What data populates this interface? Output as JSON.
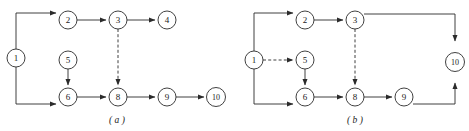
{
  "figure": {
    "background_color": "#ffffff",
    "stroke_color": "#2b2b2b",
    "text_color": "#1a1a1a",
    "width": 469,
    "height": 131
  },
  "panels": [
    {
      "id": "panel-a",
      "caption": "( a )",
      "caption_letter": "a",
      "caption_x": 117,
      "caption_y": 120,
      "nodes": [
        {
          "id": "a1",
          "label": "1",
          "cx": 16,
          "cy": 58,
          "r": 9
        },
        {
          "id": "a2",
          "label": "2",
          "cx": 68,
          "cy": 20,
          "r": 9
        },
        {
          "id": "a3",
          "label": "3",
          "cx": 118,
          "cy": 20,
          "r": 9
        },
        {
          "id": "a4",
          "label": "4",
          "cx": 167,
          "cy": 20,
          "r": 9
        },
        {
          "id": "a5",
          "label": "5",
          "cx": 68,
          "cy": 60,
          "r": 9
        },
        {
          "id": "a6",
          "label": "6",
          "cx": 68,
          "cy": 97,
          "r": 9
        },
        {
          "id": "a8",
          "label": "8",
          "cx": 118,
          "cy": 97,
          "r": 9
        },
        {
          "id": "a9",
          "label": "9",
          "cx": 167,
          "cy": 97,
          "r": 9
        },
        {
          "id": "a10",
          "label": "10",
          "cx": 216,
          "cy": 97,
          "r": 9.5
        }
      ],
      "edges": [
        {
          "id": "a-1-2",
          "from": "1",
          "to": "2",
          "style": "solid",
          "path": "M 16 49 L 16 13 L 56 13"
        },
        {
          "id": "a-2-3",
          "from": "2",
          "to": "3",
          "style": "solid",
          "path": "M 77 20 L 106 20"
        },
        {
          "id": "a-3-4",
          "from": "3",
          "to": "4",
          "style": "solid",
          "path": "M 127 20 L 155 20"
        },
        {
          "id": "a-1-6",
          "from": "1",
          "to": "6",
          "style": "solid",
          "path": "M 16 67 L 16 104 L 56 104"
        },
        {
          "id": "a-5-6",
          "from": "5",
          "to": "6",
          "style": "solid",
          "path": "M 68 69 L 68 85"
        },
        {
          "id": "a-3-8",
          "from": "3",
          "to": "8",
          "style": "dashed",
          "path": "M 118 29 L 118 85"
        },
        {
          "id": "a-6-8",
          "from": "6",
          "to": "8",
          "style": "solid",
          "path": "M 77 97 L 106 97"
        },
        {
          "id": "a-8-9",
          "from": "8",
          "to": "9",
          "style": "solid",
          "path": "M 127 97 L 155 97"
        },
        {
          "id": "a-9-10",
          "from": "9",
          "to": "10",
          "style": "solid",
          "path": "M 176 97 L 204 97"
        }
      ]
    },
    {
      "id": "panel-b",
      "caption": "( b )",
      "caption_letter": "b",
      "caption_x": 355,
      "caption_y": 120,
      "nodes": [
        {
          "id": "b1",
          "label": "1",
          "cx": 254,
          "cy": 60,
          "r": 9
        },
        {
          "id": "b2",
          "label": "2",
          "cx": 305,
          "cy": 20,
          "r": 9
        },
        {
          "id": "b3",
          "label": "3",
          "cx": 355,
          "cy": 20,
          "r": 9
        },
        {
          "id": "b5",
          "label": "5",
          "cx": 305,
          "cy": 60,
          "r": 9
        },
        {
          "id": "b6",
          "label": "6",
          "cx": 305,
          "cy": 97,
          "r": 9
        },
        {
          "id": "b8",
          "label": "8",
          "cx": 355,
          "cy": 97,
          "r": 9
        },
        {
          "id": "b9",
          "label": "9",
          "cx": 404,
          "cy": 97,
          "r": 9
        },
        {
          "id": "b10",
          "label": "10",
          "cx": 455,
          "cy": 62,
          "r": 9.5
        }
      ],
      "edges": [
        {
          "id": "b-1-2",
          "from": "1",
          "to": "2",
          "style": "solid",
          "path": "M 254 51 L 254 13 L 293 13"
        },
        {
          "id": "b-1-5",
          "from": "1",
          "to": "5",
          "style": "dashed",
          "path": "M 263 60 L 293 60"
        },
        {
          "id": "b-1-6",
          "from": "1",
          "to": "6",
          "style": "solid",
          "path": "M 254 69 L 254 104 L 293 104"
        },
        {
          "id": "b-2-3",
          "from": "2",
          "to": "3",
          "style": "solid",
          "path": "M 314 20 L 343 20"
        },
        {
          "id": "b-5-6",
          "from": "5",
          "to": "6",
          "style": "solid",
          "path": "M 305 69 L 305 85"
        },
        {
          "id": "b-3-8",
          "from": "3",
          "to": "8",
          "style": "dashed",
          "path": "M 355 29 L 355 85"
        },
        {
          "id": "b-3-10",
          "from": "3",
          "to": "10",
          "style": "solid",
          "path": "M 364 14 L 455 14 L 455 41"
        },
        {
          "id": "b-6-8",
          "from": "6",
          "to": "8",
          "style": "solid",
          "path": "M 314 97 L 343 97"
        },
        {
          "id": "b-8-9",
          "from": "8",
          "to": "9",
          "style": "solid",
          "path": "M 364 97 L 392 97"
        },
        {
          "id": "b-9-10",
          "from": "9",
          "to": "10",
          "style": "solid",
          "path": "M 413 104 L 455 104 L 455 83"
        }
      ]
    }
  ]
}
